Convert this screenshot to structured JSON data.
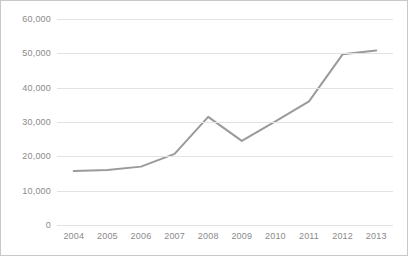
{
  "chart_data": {
    "type": "line",
    "title": "",
    "subtitle": "",
    "xlabel": "",
    "ylabel": "",
    "categories": [
      "2004",
      "2005",
      "2006",
      "2007",
      "2008",
      "2009",
      "2010",
      "2011",
      "2012",
      "2013"
    ],
    "values": [
      15700,
      16000,
      17000,
      20700,
      31500,
      24500,
      30200,
      36000,
      49700,
      50800
    ],
    "series": [
      {
        "name": "",
        "values": [
          15700,
          16000,
          17000,
          20700,
          31500,
          24500,
          30200,
          36000,
          49700,
          50800
        ]
      }
    ],
    "ylim": [
      0,
      60000
    ],
    "y_ticks": [
      0,
      10000,
      20000,
      30000,
      40000,
      50000,
      60000
    ],
    "y_tick_labels": [
      "0",
      "10,000",
      "20,000",
      "30,000",
      "40,000",
      "50,000",
      "60,000"
    ],
    "x_tick_labels": [
      "2004",
      "2005",
      "2006",
      "2007",
      "2008",
      "2009",
      "2010",
      "2011",
      "2012",
      "2013"
    ],
    "grid": true,
    "grid_axis": "y",
    "legend": false,
    "legend_position": "none",
    "markers": false,
    "annotations": [],
    "colors": {
      "line": "#9a9a9a",
      "gridline": "#e2e2e2",
      "tick_label": "#8a8a8a",
      "border": "#c8c8c8",
      "background": "#ffffff"
    },
    "line_width": 2
  }
}
